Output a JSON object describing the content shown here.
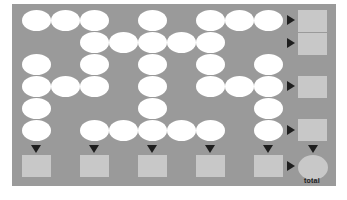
{
  "diagram": {
    "grid": {
      "columns": 9,
      "rows": 6,
      "filled": [
        [
          0,
          1,
          2,
          4,
          6,
          7,
          8
        ],
        [
          2,
          3,
          4,
          5,
          6
        ],
        [
          0,
          2,
          4,
          6,
          8
        ],
        [
          0,
          1,
          2,
          4,
          6,
          7,
          8
        ],
        [
          0,
          4,
          8
        ],
        [
          0,
          2,
          3,
          4,
          5,
          6,
          8
        ]
      ]
    },
    "row_sum_boxes": [
      0,
      1,
      3,
      5
    ],
    "column_sum_boxes": [
      0,
      2,
      4,
      6,
      8
    ],
    "total_label": "total",
    "colors": {
      "board": "#9a9a9a",
      "cell": "#ffffff",
      "box": "#c8c8c8",
      "arrow": "#1e1e1e"
    }
  }
}
